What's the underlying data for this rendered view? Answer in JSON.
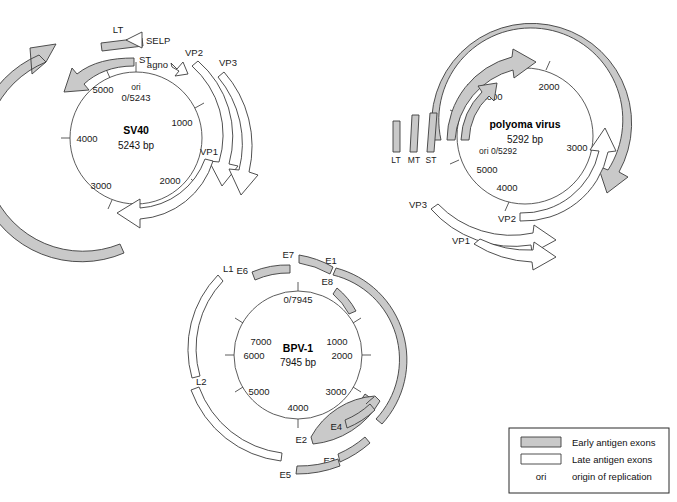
{
  "figure": {
    "colors": {
      "early_fill": "#c9c9c9",
      "late_fill": "#ffffff",
      "stroke": "#3c3c3c",
      "circle_stroke": "#4a4a4a",
      "background": "#ffffff"
    }
  },
  "legend": {
    "items": [
      {
        "swatch": "gray-bar",
        "label": "Early antigen exons"
      },
      {
        "swatch": "white-bar",
        "label": "Late antigen exons"
      },
      {
        "swatch": "ori-text",
        "swatch_label": "ori",
        "label": "origin of replication"
      }
    ]
  },
  "genomes": [
    {
      "id": "sv40",
      "name": "SV40",
      "size_label": "5243 bp",
      "size_bp": 5243,
      "ori_label": "ori",
      "ori_coord_label": "0/5243",
      "ticks": [
        {
          "label": "1000",
          "bp": 1000
        },
        {
          "label": "2000",
          "bp": 2000
        },
        {
          "label": "3000",
          "bp": 3000
        },
        {
          "label": "4000",
          "bp": 4000
        },
        {
          "label": "5000",
          "bp": 5000
        }
      ],
      "features": [
        {
          "label": "LT",
          "class": "early",
          "shape": "bar"
        },
        {
          "label": "SELP",
          "class": "late",
          "shape": "triangle-left"
        },
        {
          "label": "ST",
          "class": "early",
          "shape": "arrow"
        },
        {
          "label": "agno",
          "class": "late",
          "shape": "small-arrow"
        },
        {
          "label": "VP2",
          "class": "late",
          "shape": "arc-arrow"
        },
        {
          "label": "VP3",
          "class": "late",
          "shape": "arc-arrow"
        },
        {
          "label": "VP1",
          "class": "late",
          "shape": "arc-arrow"
        }
      ]
    },
    {
      "id": "polyoma",
      "name": "polyoma virus",
      "size_label": "5292 bp",
      "size_bp": 5292,
      "ori_label": "ori 0/5292",
      "ori_coord_label": "0/5292",
      "ticks": [
        {
          "label": "1000",
          "bp": 1000
        },
        {
          "label": "2000",
          "bp": 2000
        },
        {
          "label": "3000",
          "bp": 3000
        },
        {
          "label": "4000",
          "bp": 4000
        },
        {
          "label": "5000",
          "bp": 5000
        }
      ],
      "features": [
        {
          "label": "LT",
          "class": "early",
          "shape": "bar"
        },
        {
          "label": "MT",
          "class": "early",
          "shape": "bar"
        },
        {
          "label": "ST",
          "class": "early",
          "shape": "bar"
        },
        {
          "label": "VP2",
          "class": "late",
          "shape": "arc-arrow"
        },
        {
          "label": "VP3",
          "class": "late",
          "shape": "arc-arrow"
        },
        {
          "label": "VP1",
          "class": "late",
          "shape": "arc-arrow"
        }
      ]
    },
    {
      "id": "bpv1",
      "name": "BPV-1",
      "size_label": "7945 bp",
      "size_bp": 7945,
      "ori_label": "0/7945",
      "ori_coord_label": "0/7945",
      "ticks": [
        {
          "label": "1000",
          "bp": 1000
        },
        {
          "label": "2000",
          "bp": 2000
        },
        {
          "label": "3000",
          "bp": 3000
        },
        {
          "label": "4000",
          "bp": 4000
        },
        {
          "label": "5000",
          "bp": 5000
        },
        {
          "label": "6000",
          "bp": 6000
        },
        {
          "label": "7000",
          "bp": 7000
        }
      ],
      "features": [
        {
          "label": "E1",
          "class": "early",
          "shape": "arc"
        },
        {
          "label": "E2",
          "class": "early",
          "shape": "arc"
        },
        {
          "label": "E3",
          "class": "early",
          "shape": "arc"
        },
        {
          "label": "E4",
          "class": "early",
          "shape": "arc"
        },
        {
          "label": "E5",
          "class": "early",
          "shape": "arc"
        },
        {
          "label": "E6",
          "class": "early",
          "shape": "arc"
        },
        {
          "label": "E7",
          "class": "early",
          "shape": "arc"
        },
        {
          "label": "E8",
          "class": "early",
          "shape": "arc"
        },
        {
          "label": "L1",
          "class": "late",
          "shape": "arc"
        },
        {
          "label": "L2",
          "class": "late",
          "shape": "arc"
        }
      ]
    }
  ]
}
